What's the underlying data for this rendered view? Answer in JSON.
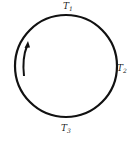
{
  "diagram": {
    "type": "cycle-circle",
    "stroke_color": "#111111",
    "background": "#ffffff",
    "circle": {
      "cx": 66,
      "cy": 66,
      "r": 51
    },
    "direction_arrow": {
      "position": "left-interior",
      "direction": "counterclockwise-up"
    },
    "labels": {
      "top": {
        "symbol": "T",
        "subscript": "1"
      },
      "right": {
        "symbol": "T",
        "subscript": "2"
      },
      "bottom": {
        "symbol": "T",
        "subscript": "3"
      }
    }
  }
}
